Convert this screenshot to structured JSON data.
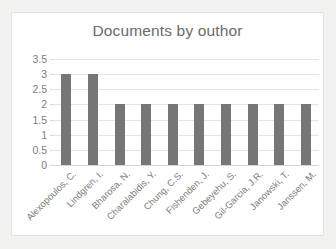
{
  "chart_data": {
    "type": "bar",
    "title": "Documents by outhor",
    "xlabel": "",
    "ylabel": "",
    "ylim": [
      0,
      3.5
    ],
    "ytick_labels": [
      "3.5",
      "3",
      "2.5",
      "2",
      "1.5",
      "1",
      "0.5",
      "0"
    ],
    "yticks": [
      3.5,
      3,
      2.5,
      2,
      1.5,
      1,
      0.5,
      0
    ],
    "grid": true,
    "legend": "none",
    "orientation": "vertical",
    "bar_color": "#767676",
    "grid_color": "#e4e4e4",
    "text_color": "#7b7b7b",
    "title_color": "#6b6b6b",
    "plot_background": "#ffffff",
    "frame_border_color": "#e2e2e2",
    "categories": [
      "Alexopoulos, C.",
      "Lindgren, I.",
      "Bharosa, N.",
      "Charalabidis, Y.",
      "Chung, C.S.",
      "Fishenden, J.",
      "Gebeyehu, S.",
      "Gil-Garcia, J.R.",
      "Janowski, T.",
      "Janssen, M."
    ],
    "values": [
      3,
      3,
      2,
      2,
      2,
      2,
      2,
      2,
      2,
      2
    ]
  }
}
